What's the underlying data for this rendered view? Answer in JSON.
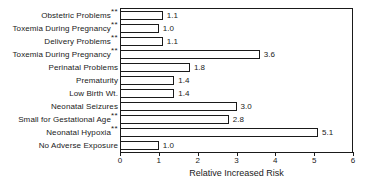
{
  "chart_data": {
    "type": "bar",
    "orientation": "horizontal",
    "title": "",
    "subtitle": "",
    "xlabel": "Relative Increased Risk",
    "ylabel": "",
    "xlim": [
      0,
      6
    ],
    "xticks": [
      0,
      1,
      2,
      3,
      4,
      5,
      6
    ],
    "xtick_labels": [
      "0",
      "1",
      "2",
      "3",
      "4",
      "5",
      "6"
    ],
    "grid": false,
    "legend": null,
    "bar_style": {
      "fill": "#ffffff",
      "edge": "#1a1a1a"
    },
    "categories": [
      "Obstetric Problems",
      "Toxemia During Pregnancy",
      "Delivery Problems",
      "Toxemia During Pregnancy",
      "Perinatal Problems",
      "Prematurity",
      "Low Birth Wt.",
      "Neonatal Seizures",
      "Small for Gestational Age",
      "Neonatal Hypoxia",
      "No Adverse Exposure"
    ],
    "category_markers": [
      "**",
      "**",
      "**",
      "**",
      "",
      "",
      "",
      "",
      "**",
      "**",
      ""
    ],
    "values": [
      1.1,
      1.0,
      1.1,
      3.6,
      1.8,
      1.4,
      1.4,
      3.0,
      2.8,
      5.1,
      1.0
    ],
    "value_labels": [
      "1.1",
      "1.0",
      "1.1",
      "3.6",
      "1.8",
      "1.4",
      "1.4",
      "3.0",
      "2.8",
      "5.1",
      "1.0"
    ],
    "bars": [
      {
        "category": "Obstetric Problems",
        "marker": "**",
        "value": 1.1,
        "label": "1.1"
      },
      {
        "category": "Toxemia During Pregnancy",
        "marker": "**",
        "value": 1.0,
        "label": "1.0"
      },
      {
        "category": "Delivery Problems",
        "marker": "**",
        "value": 1.1,
        "label": "1.1"
      },
      {
        "category": "Toxemia During Pregnancy",
        "marker": "**",
        "value": 3.6,
        "label": "3.6"
      },
      {
        "category": "Perinatal Problems",
        "marker": "",
        "value": 1.8,
        "label": "1.8"
      },
      {
        "category": "Prematurity",
        "marker": "",
        "value": 1.4,
        "label": "1.4"
      },
      {
        "category": "Low Birth Wt.",
        "marker": "",
        "value": 1.4,
        "label": "1.4"
      },
      {
        "category": "Neonatal Seizures",
        "marker": "",
        "value": 3.0,
        "label": "3.0"
      },
      {
        "category": "Small for Gestational Age",
        "marker": "**",
        "value": 2.8,
        "label": "2.8"
      },
      {
        "category": "Neonatal Hypoxia",
        "marker": "**",
        "value": 5.1,
        "label": "5.1"
      },
      {
        "category": "No Adverse Exposure",
        "marker": "",
        "value": 1.0,
        "label": "1.0"
      }
    ]
  }
}
